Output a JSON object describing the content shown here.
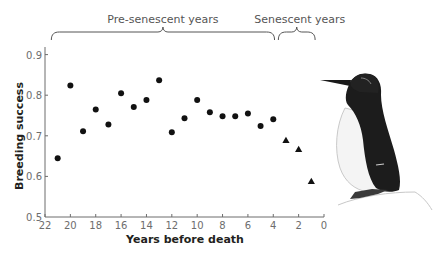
{
  "chart_data": {
    "type": "scatter",
    "title": "",
    "xlabel": "Years before death",
    "ylabel": "Breeding success",
    "xlim": [
      22,
      0
    ],
    "ylim": [
      0.5,
      0.95
    ],
    "x_reversed": true,
    "xticks": [
      22,
      20,
      18,
      16,
      14,
      12,
      10,
      8,
      6,
      4,
      2,
      0
    ],
    "yticks": [
      0.5,
      0.6,
      0.7,
      0.8,
      0.9
    ],
    "ytick_labels": [
      "0.5",
      "0.6",
      "0.7",
      "0.8",
      "0.9"
    ],
    "grid": false,
    "series": [
      {
        "name": "Pre-senescent years",
        "marker": "circle",
        "x": [
          21,
          20,
          19,
          18,
          17,
          16,
          15,
          14,
          13,
          12,
          11,
          10,
          9,
          8,
          7,
          6,
          5,
          4
        ],
        "y": [
          0.645,
          0.824,
          0.711,
          0.765,
          0.728,
          0.805,
          0.771,
          0.788,
          0.837,
          0.709,
          0.743,
          0.788,
          0.758,
          0.748,
          0.748,
          0.755,
          0.724,
          0.741
        ]
      },
      {
        "name": "Senescent years",
        "marker": "triangle",
        "x": [
          3,
          2,
          1
        ],
        "y": [
          0.689,
          0.667,
          0.588
        ]
      }
    ],
    "annotations": [
      {
        "text": "Pre-senescent years",
        "type": "brace",
        "x_range": [
          21.5,
          3.9
        ]
      },
      {
        "text": "Senescent years",
        "type": "brace",
        "x_range": [
          3.6,
          0.7
        ]
      }
    ],
    "illustration": "murre-bird"
  },
  "colors": {
    "marker": "#111111",
    "axis": "#6d6d6d",
    "text": "#231f20",
    "bracket": "#555555"
  }
}
